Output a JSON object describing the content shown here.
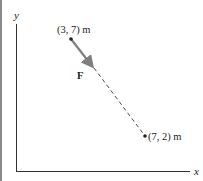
{
  "diagram": {
    "axes": {
      "x_label": "x",
      "y_label": "y",
      "color": "#333333"
    },
    "points": [
      {
        "name": "start",
        "label": "(3, 7) m",
        "coords": [
          3,
          7
        ]
      },
      {
        "name": "end",
        "label": "(7, 2) m",
        "coords": [
          7,
          2
        ]
      }
    ],
    "force": {
      "label": "F",
      "arrow_color": "#7f7f7f",
      "line_style": "dashed"
    }
  }
}
